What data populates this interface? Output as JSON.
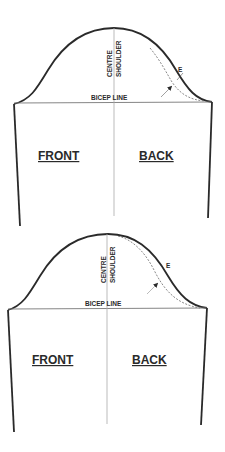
{
  "figures": [
    {
      "id": "sleeve-1",
      "labels": {
        "centre": "CENTRE",
        "shoulder": "SHOULDER",
        "bicep_line": "BICEP LINE",
        "front": "FRONT",
        "back": "BACK",
        "point": "E"
      }
    },
    {
      "id": "sleeve-2",
      "labels": {
        "centre": "CENTRE",
        "shoulder": "SHOULDER",
        "bicep_line": "BICEP LINE",
        "front": "FRONT",
        "back": "BACK",
        "point": "E"
      }
    }
  ],
  "colors": {
    "outline": "#2a2a2a",
    "guide": "#999999",
    "dashed": "#555555"
  }
}
